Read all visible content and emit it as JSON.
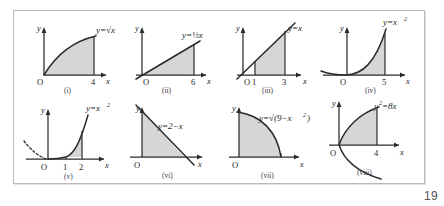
{
  "page": {
    "number": "19"
  },
  "figure": {
    "axis_x_label": "x",
    "axis_y_label": "y",
    "origin_label": "O",
    "panels": [
      {
        "id": "i",
        "roman": "(i)",
        "equation": "y=√x",
        "curve_type": "sqrt",
        "x_ticks": [
          "4"
        ],
        "shaded_from": "0",
        "shaded_to": "4"
      },
      {
        "id": "ii",
        "roman": "(ii)",
        "equation": "y=½x",
        "curve_type": "linear",
        "x_ticks": [
          "6"
        ],
        "shaded_from": "0",
        "shaded_to": "6"
      },
      {
        "id": "iii",
        "roman": "(iii)",
        "equation": "y=x",
        "curve_type": "linear",
        "x_ticks": [
          "1",
          "3"
        ],
        "shaded_from": "1",
        "shaded_to": "3"
      },
      {
        "id": "iv",
        "roman": "(iv)",
        "equation": "y=x",
        "equation_sup": "2",
        "curve_type": "parabola",
        "x_ticks": [
          "5"
        ],
        "shaded_from": "0",
        "shaded_to": "5"
      },
      {
        "id": "v",
        "roman": "(v)",
        "equation": "y=x",
        "equation_sup": "2",
        "curve_type": "parabola",
        "x_ticks": [
          "1",
          "2"
        ],
        "shaded_from": "1",
        "shaded_to": "2"
      },
      {
        "id": "vi",
        "roman": "(vi)",
        "equation": "y=2−x",
        "curve_type": "linear-decreasing",
        "x_ticks": [],
        "shaded_from": "0",
        "shaded_to": "2"
      },
      {
        "id": "vii",
        "roman": "(vii)",
        "equation": "y=√(9−x",
        "equation_sup": "2",
        "equation_tail": ")",
        "curve_type": "quarter-circle",
        "x_ticks": [],
        "shaded_from": "0",
        "shaded_to": "3"
      },
      {
        "id": "viii",
        "roman": "(viii)",
        "equation": "y",
        "equation_sup": "2",
        "equation_tail": "=8x",
        "curve_type": "sideways-parabola",
        "x_ticks": [
          "4"
        ],
        "shaded_from": "0",
        "shaded_to": "4"
      }
    ]
  }
}
